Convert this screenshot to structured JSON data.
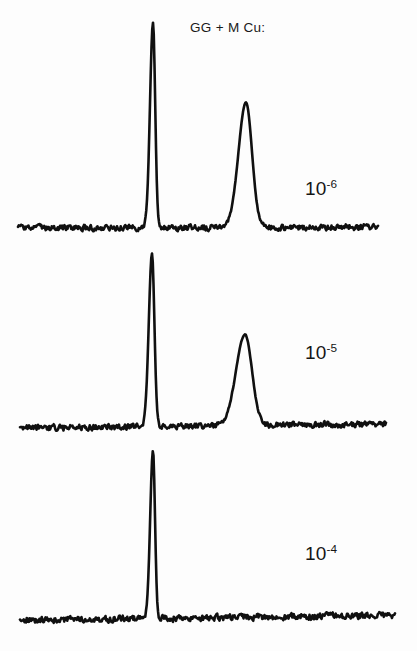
{
  "figure": {
    "title": "GG + M Cu:",
    "background_color": "#fdfdfd",
    "trace_color": "#101010",
    "width": 417,
    "height": 651
  },
  "panels": [
    {
      "label_mantissa": "10",
      "label_exponent": "-6",
      "label_full": "10-6",
      "concentration": "1e-6"
    },
    {
      "label_mantissa": "10",
      "label_exponent": "-5",
      "label_full": "10-5",
      "concentration": "1e-5"
    },
    {
      "label_mantissa": "10",
      "label_exponent": "-4",
      "label_full": "10-4",
      "concentration": "1e-4"
    }
  ],
  "chart_data": {
    "type": "line",
    "title": "GG + M Cu:",
    "xlabel": "",
    "ylabel": "",
    "grid": false,
    "axes_visible": false,
    "legend": "none",
    "annotations": [
      {
        "text": "10-6",
        "x": 305,
        "y": 190
      },
      {
        "text": "10-5",
        "x": 305,
        "y": 354
      },
      {
        "text": "10-4",
        "x": 305,
        "y": 555
      },
      {
        "text": "GG + M Cu:",
        "x": 190,
        "y": 28
      }
    ],
    "series": [
      {
        "name": "10-6",
        "baseline_y": 228,
        "x_start": 18,
        "x_end": 378,
        "noise_amplitude": 4.0,
        "baseline_tilt": -1.0,
        "peaks": [
          {
            "center": 153,
            "height": 205,
            "width": 3.0,
            "tail": 2.2,
            "shape": "sharp"
          },
          {
            "center": 246,
            "height": 125,
            "width": 7.5,
            "tail": 6.0,
            "shape": "broad"
          }
        ]
      },
      {
        "name": "10-5",
        "baseline_y": 428,
        "x_start": 20,
        "x_end": 386,
        "noise_amplitude": 4.2,
        "baseline_tilt": -4.0,
        "peaks": [
          {
            "center": 152,
            "height": 173,
            "width": 3.2,
            "tail": 2.4,
            "shape": "sharp"
          },
          {
            "center": 245,
            "height": 91,
            "width": 9.0,
            "tail": 7.0,
            "shape": "broad"
          }
        ]
      },
      {
        "name": "10-4",
        "baseline_y": 620,
        "x_start": 20,
        "x_end": 395,
        "noise_amplitude": 4.4,
        "baseline_tilt": -4.5,
        "peaks": [
          {
            "center": 153,
            "height": 168,
            "width": 2.8,
            "tail": 2.0,
            "shape": "sharp"
          }
        ]
      }
    ]
  }
}
